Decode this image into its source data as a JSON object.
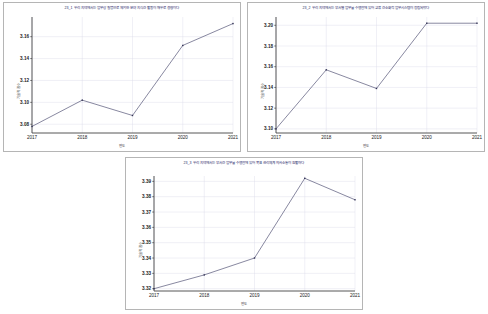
{
  "page": {
    "background": "#ffffff",
    "panel_border": "#b5b5b5",
    "title_color": "#2a2a6a",
    "line_color": "#555577",
    "grid_color": "#d9d9e8"
  },
  "charts": [
    {
      "id": "chart-1",
      "title": "23_1 우리 지역에서는 업무상 질병으로 제외한 분야 지식간 활동이 매우로 경향이다",
      "xlabel": "연도",
      "ylabel": "기술적 점수",
      "chart_data": {
        "type": "line",
        "title": "23_1 우리 지역에서는 업무상 질병으로 제외한 분야 지식간 활동이 매우로 경향이다",
        "xlabel": "연도",
        "ylabel": "기술적 점수",
        "categories": [
          "2017",
          "2018",
          "2019",
          "2020",
          "2021"
        ],
        "x": [
          2017,
          2018,
          2019,
          2020,
          2021
        ],
        "values": [
          3.078,
          3.102,
          3.088,
          3.152,
          3.172
        ],
        "series": [
          {
            "name": "기술적 점수",
            "values": [
              3.078,
              3.102,
              3.088,
              3.152,
              3.172
            ]
          }
        ],
        "yticks": [
          "3.08",
          "3.10",
          "3.12",
          "3.14",
          "3.16"
        ],
        "ytick_values": [
          3.08,
          3.1,
          3.12,
          3.14,
          3.16
        ],
        "ylim": [
          3.072,
          3.178
        ],
        "xlim": [
          2017,
          2021
        ],
        "grid": true,
        "legend": "none",
        "markers": true
      }
    },
    {
      "id": "chart-2",
      "title": "23_2 우리 지역에서는 부서별 업무를 수행함에 있어 교류 간소화적 업무시스템이 정립되었다",
      "xlabel": "연도",
      "ylabel": "기술적 점수",
      "chart_data": {
        "type": "line",
        "title": "23_2 우리 지역에서는 부서별 업무를 수행함에 있어 교류 간소화적 업무시스템이 정립되었다",
        "xlabel": "연도",
        "ylabel": "기술적 점수",
        "categories": [
          "2017",
          "2018",
          "2019",
          "2020",
          "2021"
        ],
        "x": [
          2017,
          2018,
          2019,
          2020,
          2021
        ],
        "values": [
          3.1,
          3.157,
          3.139,
          3.202,
          3.202
        ],
        "series": [
          {
            "name": "기술적 점수",
            "values": [
              3.1,
              3.157,
              3.139,
              3.202,
              3.202
            ]
          }
        ],
        "yticks": [
          "3.10",
          "3.12",
          "3.14",
          "3.16",
          "3.18",
          "3.20"
        ],
        "ytick_values": [
          3.1,
          3.12,
          3.14,
          3.16,
          3.18,
          3.2
        ],
        "ylim": [
          3.096,
          3.208
        ],
        "xlim": [
          2017,
          2021
        ],
        "grid": true,
        "legend": "none",
        "markers": true
      }
    },
    {
      "id": "chart-3",
      "title": "23_3 우리 지역에서는 부서간 업무를 수행함에 있어 목표 관리체계 의사소통이 원활하다",
      "xlabel": "연도",
      "ylabel": "기술적 점수",
      "chart_data": {
        "type": "line",
        "title": "23_3 우리 지역에서는 부서간 업무를 수행함에 있어 목표 관리체계 의사소통이 원활하다",
        "xlabel": "연도",
        "ylabel": "기술적 점수",
        "categories": [
          "2017",
          "2018",
          "2019",
          "2020",
          "2021"
        ],
        "x": [
          2017,
          2018,
          2019,
          2020,
          2021
        ],
        "values": [
          3.32,
          3.329,
          3.34,
          3.392,
          3.378
        ],
        "series": [
          {
            "name": "기술적 점수",
            "values": [
              3.32,
              3.329,
              3.34,
              3.392,
              3.378
            ]
          }
        ],
        "yticks": [
          "3.32",
          "3.33",
          "3.34",
          "3.35",
          "3.36",
          "3.37",
          "3.38",
          "3.39"
        ],
        "ytick_values": [
          3.32,
          3.33,
          3.34,
          3.35,
          3.36,
          3.37,
          3.38,
          3.39
        ],
        "ylim": [
          3.3185,
          3.3935
        ],
        "xlim": [
          2017,
          2021
        ],
        "grid": true,
        "legend": "none",
        "markers": true
      }
    }
  ]
}
